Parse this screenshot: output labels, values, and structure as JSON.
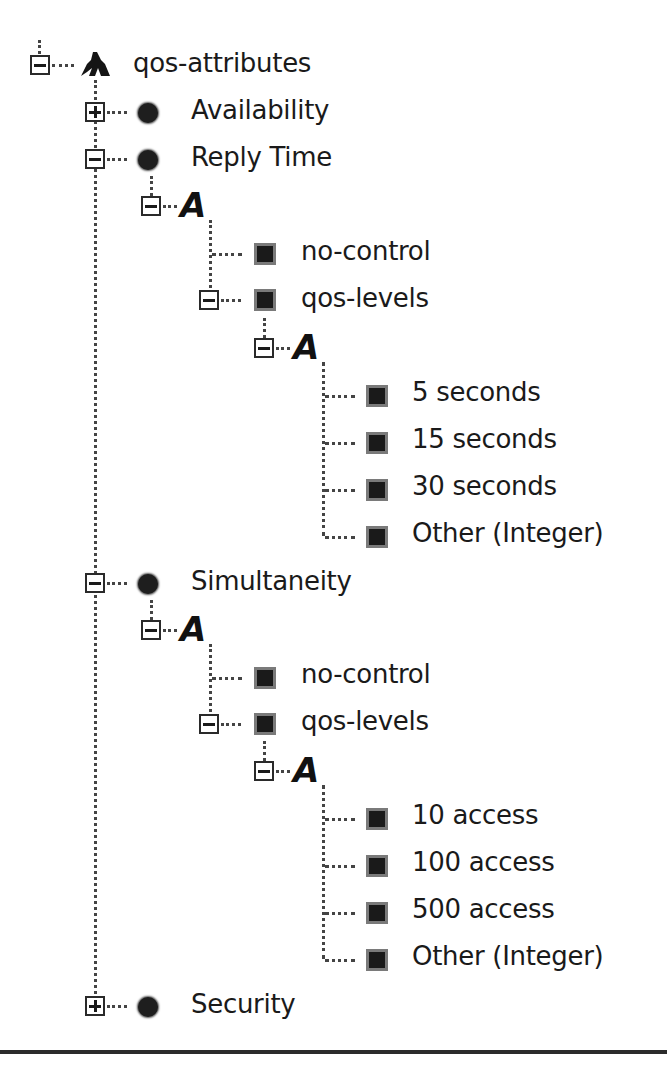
{
  "tree": {
    "root": {
      "label": "qos-attributes",
      "icon": "sequence-icon",
      "expanded": true
    },
    "nodes": [
      {
        "id": "availability",
        "label": "Availability",
        "icon": "element-dot-icon",
        "expanded": false
      },
      {
        "id": "reply-time",
        "label": "Reply Time",
        "icon": "element-dot-icon",
        "expanded": true,
        "choice": {
          "icon": "choice-icon",
          "expanded": true
        },
        "children": [
          {
            "label": "no-control",
            "icon": "leaf-square-icon"
          },
          {
            "label": "qos-levels",
            "icon": "leaf-square-icon",
            "expanded": true,
            "choice": {
              "icon": "choice-icon",
              "expanded": true
            },
            "children": [
              {
                "label": "5 seconds",
                "icon": "leaf-square-icon"
              },
              {
                "label": "15 seconds",
                "icon": "leaf-square-icon"
              },
              {
                "label": "30 seconds",
                "icon": "leaf-square-icon"
              },
              {
                "label": "Other (Integer)",
                "icon": "leaf-square-icon"
              }
            ]
          }
        ]
      },
      {
        "id": "simultaneity",
        "label": "Simultaneity",
        "icon": "element-dot-icon",
        "expanded": true,
        "choice": {
          "icon": "choice-icon",
          "expanded": true
        },
        "children": [
          {
            "label": "no-control",
            "icon": "leaf-square-icon"
          },
          {
            "label": "qos-levels",
            "icon": "leaf-square-icon",
            "expanded": true,
            "choice": {
              "icon": "choice-icon",
              "expanded": true
            },
            "children": [
              {
                "label": "10 access",
                "icon": "leaf-square-icon"
              },
              {
                "label": "100 access",
                "icon": "leaf-square-icon"
              },
              {
                "label": "500 access",
                "icon": "leaf-square-icon"
              },
              {
                "label": "Other (Integer)",
                "icon": "leaf-square-icon"
              }
            ]
          }
        ]
      },
      {
        "id": "security",
        "label": "Security",
        "icon": "element-dot-icon",
        "expanded": false
      }
    ]
  },
  "glyphs": {
    "expanded": "−",
    "collapsed": "+",
    "choice": "A"
  }
}
